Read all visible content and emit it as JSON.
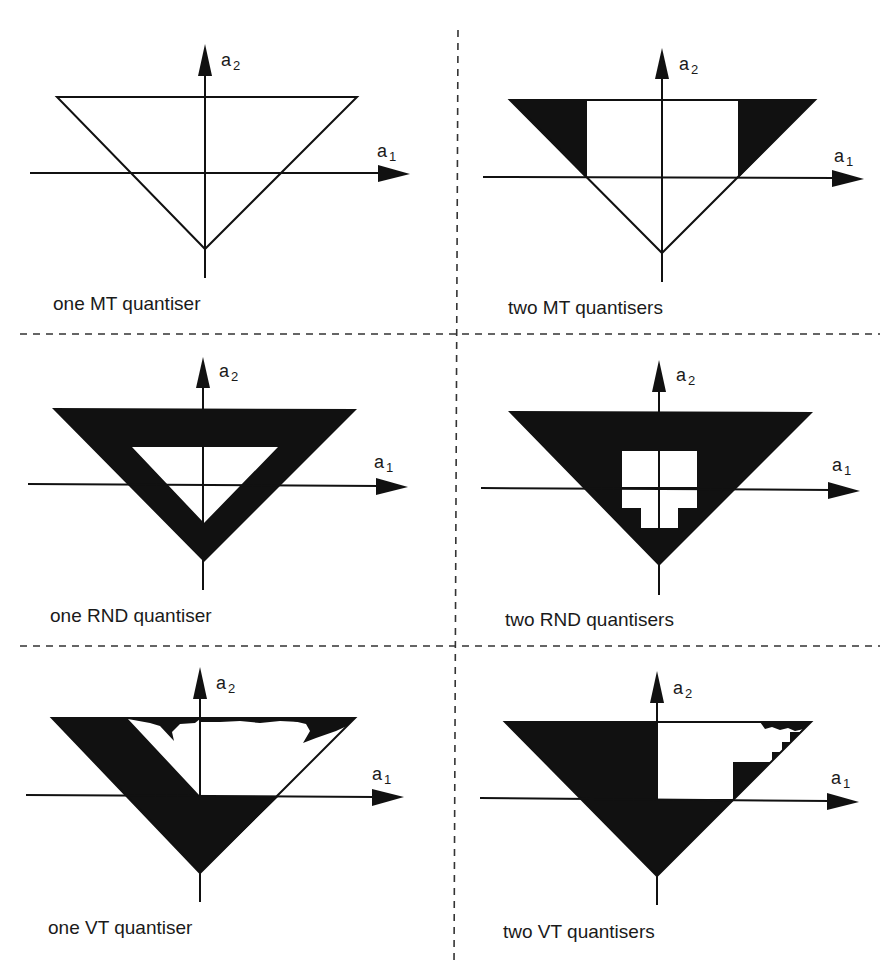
{
  "figure": {
    "colors": {
      "ink": "#111111",
      "background": "#ffffff",
      "divider": "#333333"
    },
    "axis_labels": {
      "horizontal": "a",
      "horizontal_sub": "1",
      "vertical": "a",
      "vertical_sub": "2"
    },
    "panels": [
      {
        "id": "one-mt",
        "caption": "one MT quantiser",
        "row": 0,
        "col": 0
      },
      {
        "id": "two-mt",
        "caption": "two MT quantisers",
        "row": 0,
        "col": 1
      },
      {
        "id": "one-rnd",
        "caption": "one RND quantiser",
        "row": 1,
        "col": 0
      },
      {
        "id": "two-rnd",
        "caption": "two RND quantisers",
        "row": 1,
        "col": 1
      },
      {
        "id": "one-vt",
        "caption": "one VT quantiser",
        "row": 2,
        "col": 0
      },
      {
        "id": "two-vt",
        "caption": "two VT quantisers",
        "row": 2,
        "col": 1
      }
    ]
  }
}
